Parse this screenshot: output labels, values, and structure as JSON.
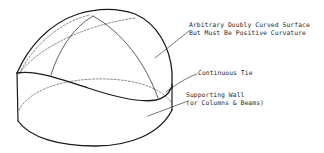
{
  "diagram": {
    "type": "engineering-line-drawing",
    "stroke_color": "#1a1a1a",
    "background_color": "#ffffff"
  },
  "labels": {
    "surface": {
      "line1": "Arbitrary Doubly Curved Surface",
      "line2": "But Must Be Positive Curvature"
    },
    "tie": {
      "line1": "Continuous Tie"
    },
    "wall": {
      "line1": "Supporting Wall",
      "line2": "(or Columns & Beams)"
    }
  }
}
